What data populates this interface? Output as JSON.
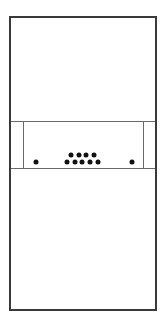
{
  "diagram": {
    "colors": {
      "frame": "#3a3a3a",
      "lines": "#6a6a6a",
      "dots": "#111111",
      "background": "#ffffff"
    },
    "outer_frame": {
      "left": 9,
      "top": 16,
      "right": 155,
      "bottom": 309
    },
    "band": {
      "top": 121,
      "bottom": 168
    },
    "inner_box": {
      "left": 23,
      "right": 143,
      "top": 121,
      "bottom": 168
    },
    "dots": {
      "left_single": {
        "x": 36,
        "y": 162
      },
      "right_single": {
        "x": 132,
        "y": 162
      },
      "cluster_top_row": [
        {
          "x": 71,
          "y": 155
        },
        {
          "x": 79,
          "y": 155
        },
        {
          "x": 86,
          "y": 155
        },
        {
          "x": 94,
          "y": 155
        }
      ],
      "cluster_bottom_row": [
        {
          "x": 67,
          "y": 162
        },
        {
          "x": 75,
          "y": 162
        },
        {
          "x": 82,
          "y": 162
        },
        {
          "x": 90,
          "y": 162
        },
        {
          "x": 98,
          "y": 162
        }
      ]
    },
    "counts": {
      "single_dots": 2,
      "cluster_dots": 9,
      "total_dots": 11
    }
  }
}
